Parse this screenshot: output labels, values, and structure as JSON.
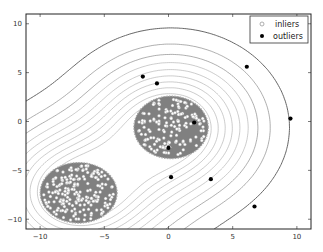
{
  "chart_data": {
    "type": "scatter",
    "title": "",
    "xlabel": "",
    "ylabel": "",
    "xlim": [
      -11.1,
      11.1
    ],
    "ylim": [
      -11,
      11
    ],
    "xticks": [
      -10,
      -5,
      0,
      5,
      10
    ],
    "yticks": [
      -10,
      -5,
      0,
      5,
      10
    ],
    "grid": false,
    "legend": {
      "position": "upper right",
      "entries": [
        {
          "label": "inliers",
          "marker": "open-circle",
          "color": "#ffffff"
        },
        {
          "label": "outliers",
          "marker": "filled-circle",
          "color": "#000000"
        }
      ]
    },
    "inlier_clusters": [
      {
        "center": [
          0.2,
          -0.6
        ],
        "radius_x": 2.9,
        "radius_y": 3.2,
        "count": 150
      },
      {
        "center": [
          -7.0,
          -7.3
        ],
        "radius_x": 3.0,
        "radius_y": 3.1,
        "count": 200
      }
    ],
    "series": [
      {
        "name": "outliers",
        "points": [
          [
            -2.0,
            4.6
          ],
          [
            -0.9,
            3.9
          ],
          [
            6.1,
            5.6
          ],
          [
            2.0,
            -0.1
          ],
          [
            0.0,
            -2.7
          ],
          [
            0.2,
            -5.7
          ],
          [
            3.3,
            -5.9
          ],
          [
            6.7,
            -8.7
          ],
          [
            9.5,
            0.3
          ]
        ]
      }
    ],
    "decision_region_color": "#808080",
    "contour_levels": 10,
    "contour_color": "#555555"
  }
}
